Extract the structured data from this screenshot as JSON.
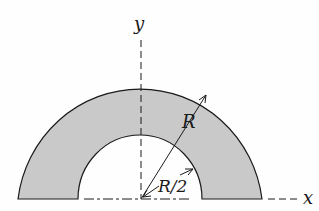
{
  "figure": {
    "labels": {
      "y_axis": "y",
      "x_axis": "x",
      "outer_radius": "R",
      "inner_radius": "R/2"
    },
    "colors": {
      "fill": "#c9c9c9",
      "stroke": "#1a1a1a",
      "background": "#fefefe"
    }
  }
}
